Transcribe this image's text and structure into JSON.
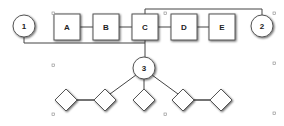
{
  "diagram": {
    "circles": [
      {
        "id": "1",
        "label": "1",
        "cx": 24,
        "cy": 26
      },
      {
        "id": "2",
        "label": "2",
        "cx": 262,
        "cy": 26
      },
      {
        "id": "3",
        "label": "3",
        "cx": 144,
        "cy": 68
      }
    ],
    "boxes": [
      {
        "id": "A",
        "label": "A",
        "x": 54,
        "y": 14,
        "w": 26,
        "h": 26
      },
      {
        "id": "B",
        "label": "B",
        "x": 93,
        "y": 14,
        "w": 26,
        "h": 26
      },
      {
        "id": "C",
        "label": "C",
        "x": 132,
        "y": 14,
        "w": 26,
        "h": 26
      },
      {
        "id": "D",
        "label": "D",
        "x": 171,
        "y": 14,
        "w": 26,
        "h": 26
      },
      {
        "id": "E",
        "label": "E",
        "x": 209,
        "y": 14,
        "w": 26,
        "h": 26
      }
    ],
    "diamonds": [
      {
        "id": "d1",
        "cx": 66,
        "cy": 100
      },
      {
        "id": "d2",
        "cx": 105,
        "cy": 100
      },
      {
        "id": "d3",
        "cx": 144,
        "cy": 100
      },
      {
        "id": "d4",
        "cx": 183,
        "cy": 100
      },
      {
        "id": "d5",
        "cx": 221,
        "cy": 100
      }
    ],
    "handles": [
      {
        "x": 53,
        "y": 13
      },
      {
        "x": 164,
        "y": 13
      },
      {
        "x": 274,
        "y": 13
      },
      {
        "x": 53,
        "y": 64
      },
      {
        "x": 274,
        "y": 62
      },
      {
        "x": 53,
        "y": 113
      },
      {
        "x": 164,
        "y": 113
      },
      {
        "x": 274,
        "y": 112
      }
    ]
  }
}
